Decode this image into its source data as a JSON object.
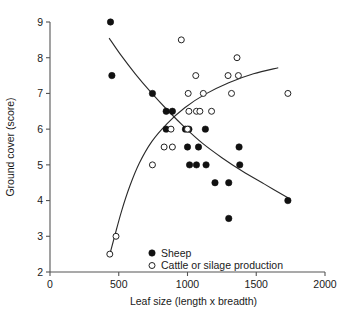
{
  "chart_data": {
    "type": "scatter",
    "title": "",
    "xlabel": "Leaf size (length x breadth)",
    "ylabel": "Ground cover (score)",
    "xlim": [
      0,
      2000
    ],
    "ylim": [
      2,
      9
    ],
    "xticks": [
      0,
      500,
      1000,
      1500,
      2000
    ],
    "yticks": [
      2,
      3,
      4,
      5,
      6,
      7,
      8,
      9
    ],
    "xtick_labels": [
      "0",
      "500",
      "1000",
      "1500",
      "2000"
    ],
    "ytick_labels": [
      "2",
      "3",
      "4",
      "5",
      "6",
      "7",
      "8",
      "9"
    ],
    "grid": false,
    "legend_position": "bottom-center",
    "series": [
      {
        "name": "Sheep",
        "marker": "filled-circle",
        "color": "#111111",
        "points": [
          [
            440,
            9.0
          ],
          [
            450,
            7.5
          ],
          [
            745,
            7.0
          ],
          [
            845,
            6.5
          ],
          [
            890,
            6.5
          ],
          [
            845,
            6.0
          ],
          [
            985,
            6.0
          ],
          [
            1010,
            6.0
          ],
          [
            1130,
            6.0
          ],
          [
            1000,
            5.5
          ],
          [
            1080,
            5.5
          ],
          [
            1375,
            5.5
          ],
          [
            1015,
            5.0
          ],
          [
            1065,
            5.0
          ],
          [
            1135,
            5.0
          ],
          [
            1380,
            5.0
          ],
          [
            1200,
            4.5
          ],
          [
            1300,
            4.5
          ],
          [
            1730,
            4.0
          ],
          [
            1300,
            3.5
          ]
        ],
        "trend": {
          "shape": "decreasing-curve",
          "points": [
            [
              430,
              8.55
            ],
            [
              520,
              8.05
            ],
            [
              620,
              7.55
            ],
            [
              730,
              7.05
            ],
            [
              850,
              6.55
            ],
            [
              980,
              6.05
            ],
            [
              1110,
              5.6
            ],
            [
              1250,
              5.2
            ],
            [
              1400,
              4.82
            ],
            [
              1560,
              4.46
            ],
            [
              1730,
              4.08
            ]
          ]
        }
      },
      {
        "name": "Cattle or silage production",
        "marker": "open-circle",
        "color": "#222222",
        "points": [
          [
            955,
            8.5
          ],
          [
            1360,
            8.0
          ],
          [
            1060,
            7.5
          ],
          [
            1295,
            7.5
          ],
          [
            1370,
            7.5
          ],
          [
            1005,
            7.0
          ],
          [
            1115,
            7.0
          ],
          [
            1320,
            7.0
          ],
          [
            1730,
            7.0
          ],
          [
            1010,
            6.5
          ],
          [
            1065,
            6.5
          ],
          [
            1090,
            6.5
          ],
          [
            1175,
            6.5
          ],
          [
            880,
            6.0
          ],
          [
            1000,
            6.0
          ],
          [
            830,
            5.5
          ],
          [
            890,
            5.5
          ],
          [
            745,
            5.0
          ],
          [
            480,
            3.0
          ],
          [
            435,
            2.5
          ]
        ],
        "trend": {
          "shape": "increasing-curve",
          "points": [
            [
              432,
              2.45
            ],
            [
              470,
              3.0
            ],
            [
              520,
              3.7
            ],
            [
              580,
              4.4
            ],
            [
              650,
              5.05
            ],
            [
              740,
              5.65
            ],
            [
              850,
              6.15
            ],
            [
              980,
              6.6
            ],
            [
              1130,
              6.98
            ],
            [
              1300,
              7.3
            ],
            [
              1480,
              7.55
            ],
            [
              1660,
              7.72
            ]
          ]
        }
      }
    ],
    "legend": [
      {
        "label": "Sheep",
        "marker": "filled-circle"
      },
      {
        "label": "Cattle or silage production",
        "marker": "open-circle"
      }
    ]
  }
}
